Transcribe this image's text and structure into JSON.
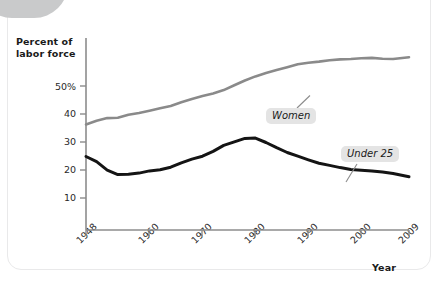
{
  "figure": {
    "y_axis_title": "Percent of labor force",
    "x_axis_title": "Year"
  },
  "axes": {
    "y_ticks": [
      "50%",
      "40",
      "30",
      "20",
      "10"
    ],
    "x_ticks": [
      "1948",
      "1960",
      "1970",
      "1980",
      "1990",
      "2000",
      "2009"
    ]
  },
  "labels": {
    "women": "Women",
    "under25": "Under 25"
  },
  "colors": {
    "women_line": "#8a8a8a",
    "under25_line": "#141414",
    "axis": "#8c8c8c",
    "label_background": "#e4e4e4",
    "corner_tab": "#c9cacb",
    "card_border": "#e9e9ea"
  },
  "chart_data": {
    "type": "line",
    "title": "",
    "subtitle": "",
    "xlabel": "Year",
    "ylabel": "Percent of labor force",
    "xlim": [
      1948,
      2009
    ],
    "ylim": [
      0,
      52
    ],
    "yticks": [
      10,
      20,
      30,
      40,
      50
    ],
    "ytick_labels": [
      "10",
      "20",
      "30",
      "40",
      "50%"
    ],
    "xticks": [
      1948,
      1960,
      1970,
      1980,
      1990,
      2000,
      2009
    ],
    "grid": false,
    "legend": "inline-annotations",
    "annotations": [
      {
        "text": "Women",
        "x": 1989,
        "y": 38.5,
        "points_to": {
          "x": 1991,
          "y": 45.0
        }
      },
      {
        "text": "Under 25",
        "x": 1999,
        "y": 21.5,
        "points_to": {
          "x": 1997,
          "y": 16.2
        }
      }
    ],
    "series": [
      {
        "name": "Women",
        "color": "#8a8a8a",
        "x": [
          1948,
          1950,
          1952,
          1954,
          1956,
          1958,
          1960,
          1962,
          1964,
          1966,
          1968,
          1970,
          1972,
          1974,
          1976,
          1978,
          1980,
          1982,
          1984,
          1986,
          1988,
          1990,
          1992,
          1994,
          1996,
          1998,
          2000,
          2002,
          2004,
          2006,
          2009
        ],
        "values": [
          28.6,
          29.6,
          30.3,
          30.4,
          31.2,
          31.7,
          32.3,
          33.0,
          33.6,
          34.6,
          35.5,
          36.3,
          37.0,
          37.9,
          39.2,
          40.5,
          41.6,
          42.5,
          43.3,
          44.1,
          44.9,
          45.3,
          45.6,
          46.0,
          46.2,
          46.3,
          46.5,
          46.6,
          46.4,
          46.3,
          46.8
        ]
      },
      {
        "name": "Under 25",
        "color": "#141414",
        "x": [
          1948,
          1950,
          1952,
          1954,
          1956,
          1958,
          1960,
          1962,
          1964,
          1966,
          1968,
          1970,
          1972,
          1974,
          1976,
          1978,
          1980,
          1982,
          1984,
          1986,
          1988,
          1990,
          1992,
          1994,
          1996,
          1998,
          2000,
          2002,
          2004,
          2006,
          2009
        ],
        "values": [
          19.9,
          18.5,
          16.2,
          15.0,
          15.1,
          15.4,
          16.0,
          16.3,
          17.0,
          18.2,
          19.2,
          20.0,
          21.3,
          22.9,
          23.9,
          24.8,
          24.9,
          23.7,
          22.3,
          21.0,
          20.0,
          19.0,
          18.1,
          17.5,
          16.9,
          16.4,
          16.2,
          16.0,
          15.7,
          15.3,
          14.4
        ]
      }
    ]
  }
}
